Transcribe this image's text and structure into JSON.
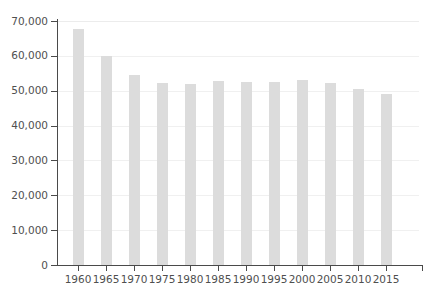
{
  "chart_data": {
    "type": "bar",
    "title": "",
    "subtitle": "",
    "xlabel": "",
    "ylabel": "",
    "categories": [
      "1960",
      "1965",
      "1970",
      "1975",
      "1980",
      "1985",
      "1990",
      "1995",
      "2000",
      "2005",
      "2010",
      "2015"
    ],
    "values": [
      67800,
      60000,
      54500,
      52100,
      51800,
      52800,
      52400,
      52500,
      53100,
      52200,
      50600,
      49000
    ],
    "series": [
      {
        "name": "",
        "values": [
          67800,
          60000,
          54500,
          52100,
          51800,
          52800,
          52400,
          52500,
          53100,
          52200,
          50600,
          49000
        ]
      }
    ],
    "ylim": [
      0,
      70000
    ],
    "y_ticks": [
      0,
      10000,
      20000,
      30000,
      40000,
      50000,
      60000,
      70000
    ],
    "y_tick_labels": [
      "0",
      "10,000",
      "20,000",
      "30,000",
      "40,000",
      "50,000",
      "60,000",
      "70,000"
    ],
    "x_tick_labels": [
      "1960",
      "1965",
      "1970",
      "1975",
      "1980",
      "1985",
      "1990",
      "1995",
      "2000",
      "2005",
      "2010",
      "2015"
    ],
    "grid": true,
    "grid_axis": "y",
    "legend": false,
    "legend_position": "none",
    "annotations": []
  },
  "style": {
    "bar_color": "#dcdcdc",
    "axis_color": "#4a4a4a",
    "gridline_color": "#f0f0f0",
    "text_color": "#4f4f4f",
    "background_color": "#ffffff"
  }
}
